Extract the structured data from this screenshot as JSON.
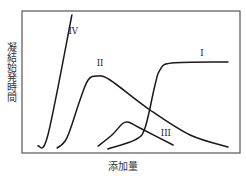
{
  "chart_data": {
    "type": "line",
    "title": "",
    "xlabel": "添加量",
    "ylabel": "凝結始発時間",
    "xlim": [
      0,
      100
    ],
    "ylim": [
      0,
      100
    ],
    "grid": false,
    "ticks": false,
    "note": "Qualitative schematic; axes have no numeric ticks. Values are normalized positions (0-100) within the plot frame.",
    "series": [
      {
        "name": "I",
        "points": [
          [
            39.4,
            2.8
          ],
          [
            51.8,
            9.2
          ],
          [
            56.4,
            17.6
          ],
          [
            61.0,
            47.9
          ],
          [
            63.3,
            58.5
          ],
          [
            68.8,
            63.4
          ],
          [
            94.5,
            64.1
          ]
        ],
        "label_at": [
          82.5,
          68.5
        ]
      },
      {
        "name": "II",
        "points": [
          [
            16.1,
            3.5
          ],
          [
            20.6,
            10.6
          ],
          [
            26.6,
            37.3
          ],
          [
            30.3,
            51.4
          ],
          [
            34.4,
            54.2
          ],
          [
            40.4,
            51.4
          ],
          [
            58.7,
            30.3
          ],
          [
            77.1,
            12.7
          ],
          [
            94.5,
            4.2
          ]
        ],
        "label_at": [
          35.8,
          61.5
        ]
      },
      {
        "name": "III",
        "points": [
          [
            34.9,
            4.9
          ],
          [
            41.3,
            12.7
          ],
          [
            45.9,
            20.4
          ],
          [
            48.6,
            21.8
          ],
          [
            54.1,
            17.6
          ],
          [
            69.3,
            5.6
          ]
        ],
        "label_at": [
          66.0,
          12.0
        ]
      },
      {
        "name": "IV",
        "points": [
          [
            7.3,
            4.9
          ],
          [
            11.9,
            12.7
          ],
          [
            22.9,
            97.2
          ]
        ],
        "label_at": [
          23.5,
          84.0
        ]
      }
    ]
  }
}
